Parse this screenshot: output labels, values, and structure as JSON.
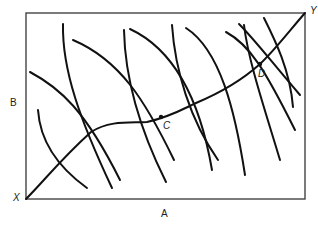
{
  "diagram": {
    "type": "edgeworth-box",
    "axis_labels": {
      "horizontal": "A",
      "vertical": "B"
    },
    "origins": {
      "bottom_left": "X",
      "top_right": "Y"
    },
    "points": [
      {
        "label": "C",
        "x": 161,
        "y": 117
      },
      {
        "label": "D",
        "x": 260,
        "y": 64
      }
    ],
    "colors": {
      "line": "#111111",
      "box": "#333333",
      "background": "#ffffff"
    }
  }
}
